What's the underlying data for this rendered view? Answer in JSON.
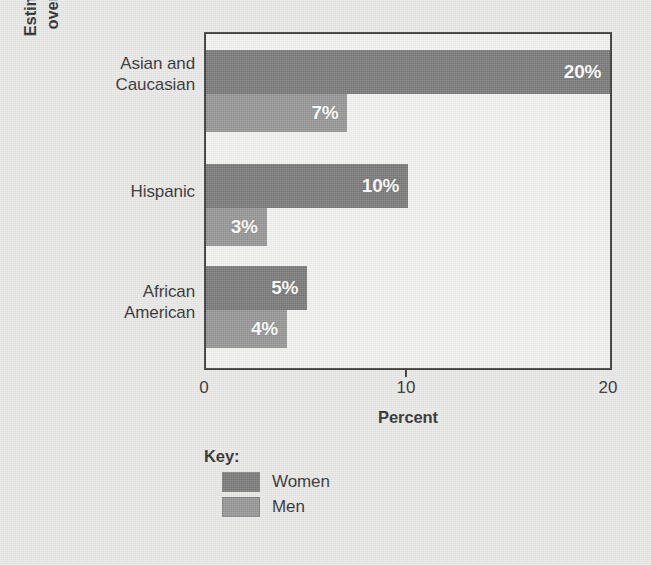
{
  "chart_data": {
    "type": "bar",
    "orientation": "horizontal",
    "title": "",
    "xlabel": "Percent",
    "ylabel": "Estimated number of adults over 50 with osteoporosis",
    "ylabel_lines": [
      "Estimated number of adults",
      "over 50 with osteoporosis"
    ],
    "categories": [
      "Asian and Caucasian",
      "Hispanic",
      "African American"
    ],
    "category_lines": [
      [
        "Asian and",
        "Caucasian"
      ],
      [
        "Hispanic"
      ],
      [
        "African",
        "American"
      ]
    ],
    "series": [
      {
        "name": "Women",
        "values": [
          20,
          10,
          5
        ],
        "value_labels": [
          "20%",
          "10%",
          "5%"
        ],
        "color": "#6e6e6e"
      },
      {
        "name": "Men",
        "values": [
          7,
          3,
          4
        ],
        "value_labels": [
          "7%",
          "3%",
          "4%"
        ],
        "color": "#8d8d8d"
      }
    ],
    "xlim": [
      0,
      20
    ],
    "xticks": [
      0,
      10,
      20
    ],
    "xtick_labels": [
      "0",
      "10",
      "20"
    ],
    "grid": false,
    "legend_position": "below-left",
    "legend_title": "Key:",
    "plot_background": "#f1f1ef",
    "page_background": "#e8e8e6",
    "axis_color": "#2b2b2b",
    "value_label_color": "#ffffff"
  },
  "legend": {
    "title": "Key:",
    "entries": [
      {
        "label": "Women",
        "color": "#6e6e6e"
      },
      {
        "label": "Men",
        "color": "#8d8d8d"
      }
    ]
  }
}
